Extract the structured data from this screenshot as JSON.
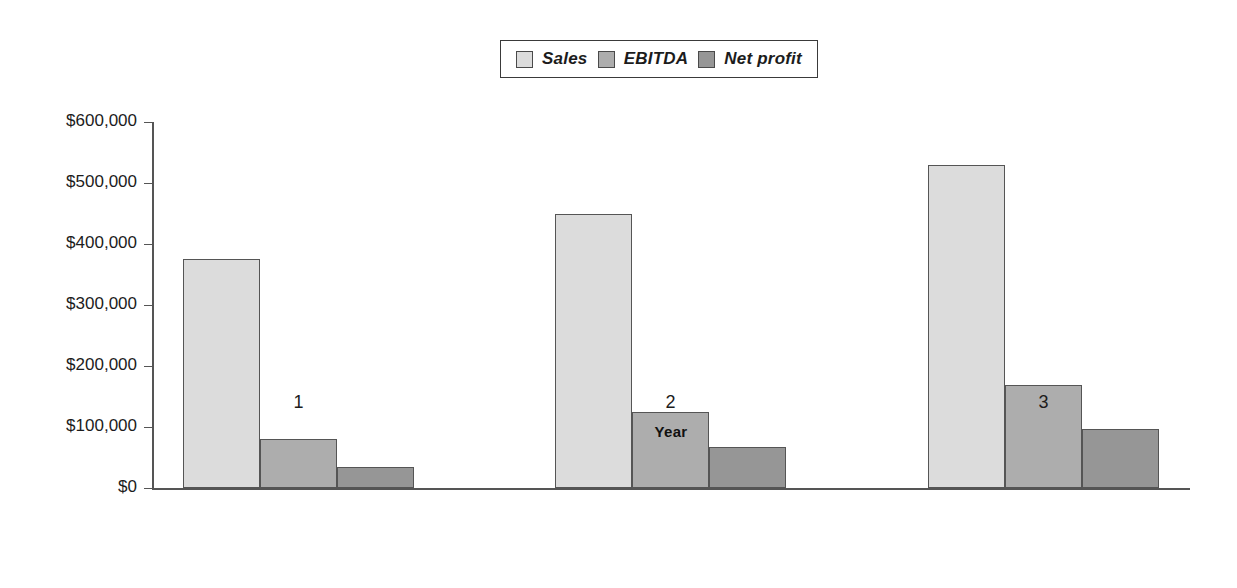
{
  "chart_data": {
    "type": "bar",
    "title": "",
    "xlabel": "Year",
    "ylabel": "",
    "categories": [
      "1",
      "2",
      "3"
    ],
    "series": [
      {
        "name": "Sales",
        "values": [
          375000,
          450000,
          530000
        ],
        "color": "#dcdcdc"
      },
      {
        "name": "EBITDA",
        "values": [
          80000,
          125000,
          169000
        ],
        "color": "#adadad"
      },
      {
        "name": "Net profit",
        "values": [
          34000,
          67000,
          97000
        ],
        "color": "#969696"
      }
    ],
    "ylim": [
      0,
      600000
    ],
    "ytick_labels": [
      "$600,000",
      "$500,000",
      "$400,000",
      "$300,000",
      "$200,000",
      "$100,000",
      "$0"
    ],
    "ytick_values": [
      600000,
      500000,
      400000,
      300000,
      200000,
      100000,
      0
    ],
    "grid": false,
    "legend_position": "top-center",
    "bar_border_color": "#555555",
    "axis_color": "#555555"
  },
  "legend": {
    "entries": [
      {
        "label": "Sales"
      },
      {
        "label": "EBITDA"
      },
      {
        "label": "Net profit"
      }
    ]
  }
}
